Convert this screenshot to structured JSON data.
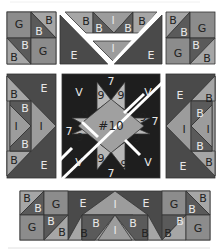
{
  "colors": {
    "G": "#9a9a9a",
    "B_light": "#a8a8a8",
    "B_dark": "#5c5c5c",
    "E": "#4a4a4a",
    "I": "#9c9c9c",
    "V": "#1e1e1e",
    "seven": "#2a2a2a",
    "nine": "#b8b8b8",
    "center": "#a0a0a0",
    "cut": "#ffffff",
    "outline": "#333333"
  },
  "labels": {
    "G": "G",
    "B": "B",
    "E": "E",
    "I": "I",
    "V": "V",
    "seven": "7",
    "nine": "9",
    "center": "#10"
  },
  "blocks": {
    "top_left": [
      "G",
      "B",
      "B",
      "B",
      "B",
      "G"
    ],
    "top_middle": [
      "B",
      "B",
      "I",
      "B",
      "B",
      "I",
      "E",
      "E"
    ],
    "top_right": [
      "B",
      "B",
      "G",
      "G",
      "B",
      "B"
    ],
    "middle_left": [
      "E",
      "B",
      "B",
      "I",
      "I",
      "B",
      "B",
      "E"
    ],
    "middle_center": [
      "V",
      "V",
      "V",
      "V",
      "7",
      "7",
      "7",
      "7",
      "9",
      "9",
      "9",
      "9",
      "9",
      "9",
      "9",
      "9",
      "#10"
    ],
    "middle_right": [
      "E",
      "B",
      "B",
      "I",
      "I",
      "B",
      "B",
      "E"
    ],
    "bottom": [
      "B",
      "B",
      "G",
      "G",
      "B",
      "B",
      "E",
      "I",
      "I",
      "E",
      "B",
      "B",
      "B",
      "B",
      "B",
      "G",
      "G",
      "B",
      "B"
    ]
  }
}
